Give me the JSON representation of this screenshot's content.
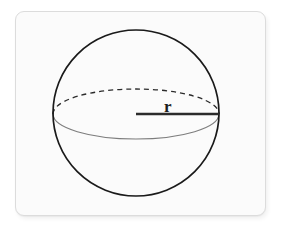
{
  "figure": {
    "kind": "geometry-diagram",
    "labels": {
      "radius": "r"
    },
    "colors": {
      "page_background": "#ffffff",
      "card_background": "#fbfbfb",
      "card_border": "#dcdcdc",
      "outline_stroke": "#1a1a1a",
      "hidden_edge_stroke": "#2b2b2b",
      "visible_edge_stroke": "#7d7d7d",
      "radius_stroke": "#2b2b2b",
      "label_color": "#1d1d1d"
    },
    "geometry": {
      "sphere_center": {
        "x": 136,
        "y": 113
      },
      "sphere_radius": 83,
      "equator_center": {
        "x": 136,
        "y": 114
      },
      "equator_rx": 83,
      "equator_ry": 25,
      "radius_line": {
        "x1": 136,
        "y1": 114,
        "x2": 219,
        "y2": 114
      },
      "radius_label_position": {
        "x": 164,
        "y": 110
      },
      "card_rect": {
        "x": 15,
        "y": 11,
        "width": 251,
        "height": 205,
        "radius": 9
      }
    },
    "strokes": {
      "sphere_outline_width": 1.7,
      "hidden_equator_width": 1.3,
      "hidden_equator_dash": "5 4",
      "visible_equator_width": 1.1,
      "radius_line_width": 2.6
    }
  }
}
